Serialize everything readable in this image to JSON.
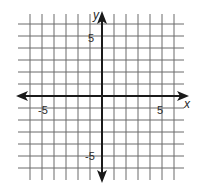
{
  "diagram": {
    "type": "coordinate-plane",
    "x_axis_label": "x",
    "y_axis_label": "y",
    "tick_labels": {
      "x_negative": "-5",
      "x_positive": "5",
      "y_positive": "5",
      "y_negative": "-5"
    },
    "x_range": [
      -6,
      6
    ],
    "y_range": [
      -6,
      6
    ],
    "grid_spacing_units": 1,
    "colors": {
      "grid": "#555555",
      "axis": "#1a1a1a",
      "background": "#ffffff"
    }
  }
}
